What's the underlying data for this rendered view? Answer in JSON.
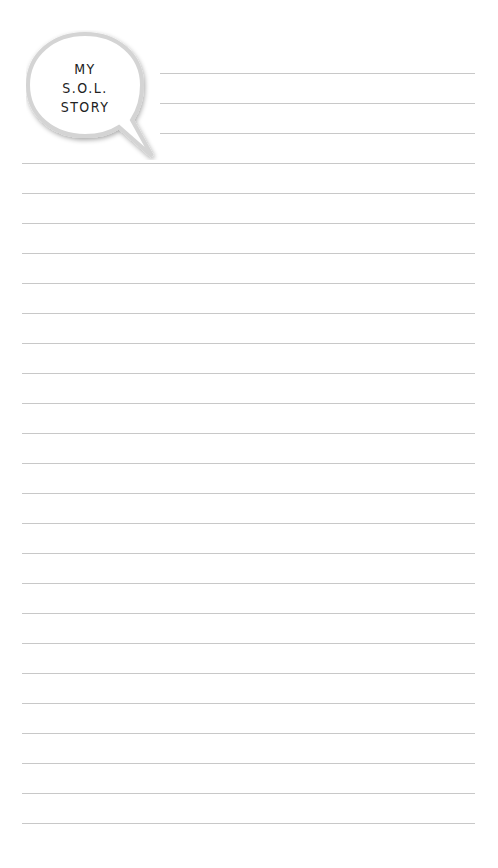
{
  "header": {
    "title_lines": [
      "MY",
      "S.O.L.",
      "STORY"
    ]
  },
  "ruled_lines": {
    "short_count": 3,
    "short_start_y": 73,
    "short_x": 160,
    "full_count": 23,
    "full_start_y": 163,
    "full_x": 22,
    "end_x": 475,
    "spacing": 30,
    "color": "#c8c8c8"
  }
}
